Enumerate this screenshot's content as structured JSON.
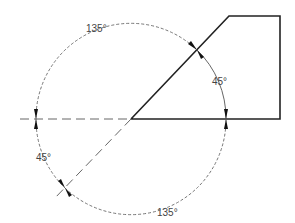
{
  "diagram": {
    "labels": {
      "top_arc": "135°",
      "right_arc": "45°",
      "left_arc": "45°",
      "bottom_arc": "135°"
    },
    "colors": {
      "object_line": "#222222",
      "dim_line": "#555555"
    }
  }
}
